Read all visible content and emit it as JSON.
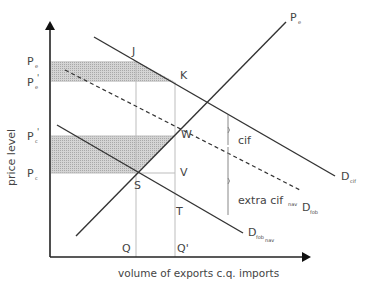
{
  "diagram": {
    "axes": {
      "y_label": "price level",
      "x_label": "volume of exports c.q. imports"
    },
    "price_labels": [
      {
        "base": "P",
        "sub": "e",
        "sup": "",
        "y": 61
      },
      {
        "base": "P",
        "sub": "e",
        "sup": "'",
        "y": 82
      },
      {
        "base": "P",
        "sub": "c",
        "sup": "'",
        "y": 136
      },
      {
        "base": "P",
        "sub": "c",
        "sup": "",
        "y": 173
      }
    ],
    "quantity_labels": [
      {
        "text": "Q",
        "x": 136
      },
      {
        "text": "Q'",
        "x": 175
      }
    ],
    "points": [
      {
        "text": "J",
        "x": 136,
        "y": 61
      },
      {
        "text": "K",
        "x": 175,
        "y": 82
      },
      {
        "text": "W",
        "x": 175,
        "y": 136
      },
      {
        "text": "S",
        "x": 136,
        "y": 173
      },
      {
        "text": "V",
        "x": 175,
        "y": 173
      },
      {
        "text": "T",
        "x": 175,
        "y": 198
      }
    ],
    "curves": {
      "supply": {
        "base": "P",
        "sub": "e"
      },
      "d_cif": {
        "base": "D",
        "sub": "cif"
      },
      "d_fob": {
        "base": "D",
        "sub": "fob"
      },
      "d_fob_nav": {
        "base": "D",
        "sub": "fob",
        "sub2": "nav"
      }
    },
    "braces": {
      "cif": "cif",
      "extra_cif": "extra cif",
      "extra_cif_sub": "nav"
    },
    "colors": {
      "line": "#333333",
      "guide": "#bbbbbb",
      "shade": "#c8c8c8",
      "text": "#444444"
    }
  }
}
